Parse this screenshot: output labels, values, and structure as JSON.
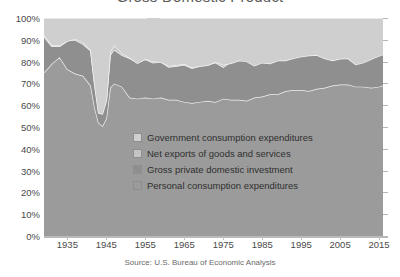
{
  "chart_data": {
    "type": "area",
    "title": "Gross Domestic Product",
    "subtitle": "",
    "xlabel": "",
    "ylabel": "",
    "stacked": true,
    "normalized_percent": true,
    "grid": true,
    "legend_position": "inside-center",
    "xlim": [
      1929,
      2016
    ],
    "ylim": [
      0,
      100
    ],
    "source": "Source: U.S. Bureau of Economic Analysis",
    "y_ticks": [
      "0%",
      "10%",
      "20%",
      "30%",
      "40%",
      "50%",
      "60%",
      "70%",
      "80%",
      "90%",
      "100%"
    ],
    "y_tick_values": [
      0,
      10,
      20,
      30,
      40,
      50,
      60,
      70,
      80,
      90,
      100
    ],
    "x_ticks": [
      "1935",
      "1945",
      "1955",
      "1965",
      "1975",
      "1985",
      "1995",
      "2005",
      "2015"
    ],
    "x_tick_values": [
      1935,
      1945,
      1955,
      1965,
      1975,
      1985,
      1995,
      2005,
      2015
    ],
    "colors": {
      "government_consumption_expenditures": "#cfcfcf",
      "net_exports_of_goods_and_services": "#c4c4c4",
      "gross_private_domestic_investment": "#8f8f8f",
      "personal_consumption_expenditures": "#9b9b9b",
      "boundary_line": "#f2f2f2",
      "plot_background": "#cfcfcf",
      "axis_text": "#4a4a4a",
      "title_text": "#5a5a5a"
    },
    "x": [
      1929,
      1931,
      1933,
      1935,
      1937,
      1939,
      1941,
      1942,
      1943,
      1944,
      1945,
      1946,
      1947,
      1949,
      1951,
      1953,
      1955,
      1957,
      1959,
      1961,
      1963,
      1965,
      1967,
      1969,
      1971,
      1973,
      1975,
      1977,
      1979,
      1981,
      1983,
      1985,
      1987,
      1989,
      1991,
      1993,
      1995,
      1997,
      1999,
      2001,
      2003,
      2005,
      2007,
      2009,
      2011,
      2013,
      2015,
      2016
    ],
    "series": [
      {
        "name": "Personal consumption expenditures",
        "color": "#9b9b9b",
        "values": [
          75.0,
          79.0,
          82.0,
          76.5,
          74.5,
          73.5,
          69.0,
          59.0,
          52.0,
          50.5,
          54.0,
          68.0,
          70.0,
          68.5,
          63.5,
          63.0,
          63.5,
          63.0,
          63.5,
          62.5,
          62.5,
          61.5,
          61.0,
          61.5,
          62.0,
          61.5,
          63.0,
          62.5,
          62.5,
          62.0,
          63.5,
          64.0,
          65.0,
          65.0,
          66.5,
          67.0,
          67.0,
          66.5,
          67.5,
          68.0,
          69.0,
          69.5,
          69.5,
          68.5,
          68.5,
          68.0,
          68.5,
          69.0
        ]
      },
      {
        "name": "Gross private domestic investment",
        "color": "#8f8f8f",
        "values": [
          16.5,
          8.0,
          5.0,
          13.0,
          15.5,
          14.5,
          16.0,
          11.0,
          6.0,
          6.5,
          8.5,
          15.0,
          15.5,
          14.5,
          18.0,
          16.5,
          17.5,
          16.5,
          16.5,
          15.0,
          15.5,
          17.0,
          16.0,
          16.5,
          16.5,
          18.0,
          14.5,
          17.5,
          18.5,
          18.5,
          16.0,
          18.0,
          17.0,
          17.0,
          14.5,
          15.5,
          16.5,
          17.5,
          18.0,
          17.0,
          16.0,
          17.5,
          17.0,
          13.0,
          14.5,
          16.0,
          17.0,
          17.0
        ]
      },
      {
        "name": "Net exports of goods and services",
        "color": "#c4c4c4",
        "values": [
          0.8,
          0.6,
          0.4,
          0.0,
          0.4,
          0.9,
          0.3,
          -0.3,
          -1.5,
          -1.0,
          -0.5,
          1.5,
          2.0,
          1.0,
          0.3,
          -0.2,
          0.2,
          0.6,
          -0.2,
          0.5,
          0.4,
          0.4,
          0.3,
          0.0,
          -0.2,
          0.4,
          1.0,
          -0.8,
          -0.5,
          -0.4,
          -1.4,
          -2.5,
          -2.9,
          -1.5,
          -0.5,
          -1.0,
          -1.2,
          -1.2,
          -2.5,
          -3.5,
          -4.5,
          -5.7,
          -5.0,
          -2.8,
          -3.5,
          -2.9,
          -2.9,
          -2.8
        ]
      },
      {
        "name": "Government consumption expenditures",
        "color": "#cfcfcf",
        "values": [
          7.7,
          12.4,
          12.6,
          10.5,
          9.6,
          11.1,
          14.7,
          30.3,
          43.5,
          44.0,
          38.0,
          15.5,
          12.5,
          16.0,
          18.2,
          20.7,
          18.8,
          20.9,
          20.2,
          22.0,
          21.6,
          21.1,
          22.7,
          22.0,
          21.7,
          20.1,
          21.5,
          20.8,
          19.5,
          19.9,
          21.9,
          20.5,
          20.9,
          19.5,
          19.5,
          18.5,
          17.7,
          17.2,
          17.0,
          18.5,
          19.5,
          18.7,
          18.5,
          21.3,
          20.5,
          18.9,
          17.4,
          16.8
        ]
      }
    ],
    "notes": [
      "100% stacked area chart of U.S. GDP expenditure components.",
      "Personal consumption collapses to roughly 50% of GDP during World War II (1943-1945) while government consumption expenditures spike to roughly 44%.",
      "Personal consumption trends upward from about 62% in the 1960s to about 69% by 2015."
    ]
  },
  "legend": {
    "items": [
      {
        "label": "Government consumption expenditures",
        "swatch": "#cfcfcf"
      },
      {
        "label": "Net exports of goods and services",
        "swatch": "#c4c4c4"
      },
      {
        "label": "Gross private domestic investment",
        "swatch": "#8f8f8f"
      },
      {
        "label": "Personal consumption expenditures",
        "swatch": "#9b9b9b"
      }
    ]
  }
}
